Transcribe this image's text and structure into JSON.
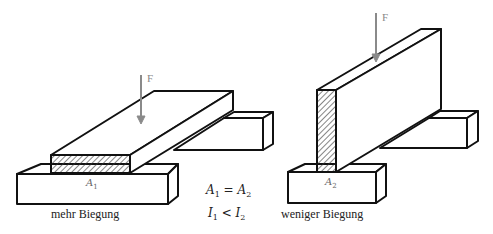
{
  "diagram": {
    "left": {
      "caption": "mehr Biegung",
      "force_label": "F",
      "area_label": "A",
      "area_sub": "1"
    },
    "right": {
      "caption": "weniger Biegung",
      "force_label": "F",
      "area_label": "A",
      "area_sub": "2"
    },
    "relations": {
      "eq1": {
        "lhs": "A",
        "lhs_sub": "1",
        "op": " = ",
        "rhs": "A",
        "rhs_sub": "2"
      },
      "eq2": {
        "lhs": "I",
        "lhs_sub": "1",
        "op": " < ",
        "rhs": "I",
        "rhs_sub": "2"
      }
    },
    "colors": {
      "stroke": "#111111",
      "force_arrow": "#8a8a8a",
      "hatch": "#333333"
    }
  }
}
